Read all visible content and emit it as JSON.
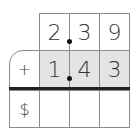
{
  "problem": {
    "row1": [
      "",
      "2",
      "3",
      "9"
    ],
    "row2": [
      "+",
      "1",
      "4",
      "3"
    ],
    "row3": [
      "$",
      "",
      "",
      ""
    ]
  },
  "colors": {
    "shade": "#e4e4e4",
    "border": "#8a8a8a",
    "rule": "#222222"
  }
}
